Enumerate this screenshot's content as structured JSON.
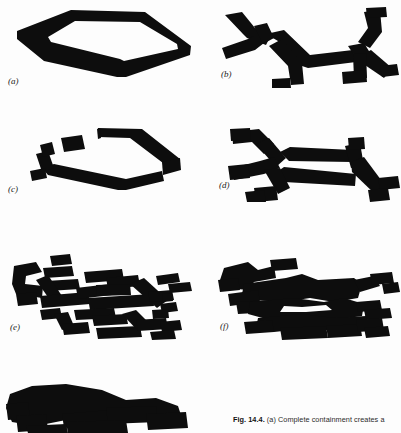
{
  "figure": {
    "number": "Fig. 14.4.",
    "caption_text": " (a) Complete containment creates a",
    "caption_line2": "which in  ",
    "panels": [
      {
        "id": "a",
        "label": "(a)",
        "description": "closed hexagonal loop ribbon, complete containment"
      },
      {
        "id": "b",
        "label": "(b)",
        "description": "open branching dendritic tree, no closed loop"
      },
      {
        "id": "c",
        "label": "(c)",
        "description": "broken loop with detached fragments, incomplete containment"
      },
      {
        "id": "d",
        "label": "(d)",
        "description": "branching network with one closed loop"
      },
      {
        "id": "e",
        "label": "(e)",
        "description": "dense fragmented network of many short segments"
      },
      {
        "id": "f",
        "label": "(f)",
        "description": "coalesced dense network with thick merged masses"
      },
      {
        "id": "g",
        "label": "(g)",
        "description": "fully merged solid mass, bottom panel cropped"
      }
    ]
  },
  "colors": {
    "ink": "#0d0d0d",
    "page": "#fdfdfd",
    "caption": "#2b2b2b"
  }
}
